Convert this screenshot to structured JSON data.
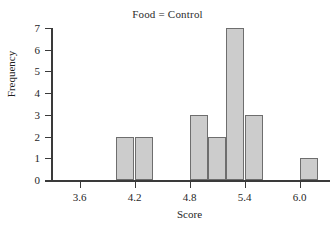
{
  "chart_data": {
    "type": "bar",
    "title": "Food = Control",
    "xlabel": "Score",
    "ylabel": "Frequency",
    "xlim": [
      3.3,
      6.3
    ],
    "ylim": [
      0,
      7
    ],
    "bin_width": 0.2,
    "grid": false,
    "legend": null,
    "x_ticks": [
      {
        "value": 3.6,
        "label": "3.6"
      },
      {
        "value": 4.2,
        "label": "4.2"
      },
      {
        "value": 4.8,
        "label": "4.8"
      },
      {
        "value": 5.4,
        "label": "5.4"
      },
      {
        "value": 6.0,
        "label": "6.0"
      }
    ],
    "y_ticks": [
      {
        "value": 0,
        "label": "0"
      },
      {
        "value": 1,
        "label": "1"
      },
      {
        "value": 2,
        "label": "2"
      },
      {
        "value": 3,
        "label": "3"
      },
      {
        "value": 4,
        "label": "4"
      },
      {
        "value": 5,
        "label": "5"
      },
      {
        "value": 6,
        "label": "6"
      },
      {
        "value": 7,
        "label": "7"
      }
    ],
    "bars": [
      {
        "bin_start": 4.0,
        "bin_end": 4.2,
        "value": 2
      },
      {
        "bin_start": 4.2,
        "bin_end": 4.4,
        "value": 2
      },
      {
        "bin_start": 4.8,
        "bin_end": 5.0,
        "value": 3
      },
      {
        "bin_start": 5.0,
        "bin_end": 5.2,
        "value": 2
      },
      {
        "bin_start": 5.2,
        "bin_end": 5.4,
        "value": 7
      },
      {
        "bin_start": 5.4,
        "bin_end": 5.6,
        "value": 3
      },
      {
        "bin_start": 6.0,
        "bin_end": 6.2,
        "value": 1
      }
    ],
    "total_count": 20,
    "colors": {
      "bar_fill": "#cccccc",
      "bar_edge": "#6e6e6e",
      "axis": "#3a3a3a",
      "text": "#1f1f1f",
      "background": "#ffffff"
    }
  }
}
